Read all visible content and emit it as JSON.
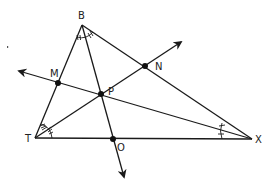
{
  "diagram": {
    "type": "triangle-angle-bisectors",
    "vertices": [
      {
        "name": "B",
        "x": 82,
        "y": 25,
        "label_x": 78,
        "label_y": 19
      },
      {
        "name": "T",
        "x": 35,
        "y": 138,
        "label_x": 25,
        "label_y": 142
      },
      {
        "name": "X",
        "x": 252,
        "y": 139,
        "label_x": 255,
        "label_y": 143
      }
    ],
    "points": [
      {
        "name": "P",
        "x": 101,
        "y": 94,
        "label_x": 108,
        "label_y": 95
      },
      {
        "name": "M",
        "x": 58,
        "y": 83,
        "label_x": 50,
        "label_y": 77
      },
      {
        "name": "N",
        "x": 145,
        "y": 66,
        "label_x": 153,
        "label_y": 70
      },
      {
        "name": "O",
        "x": 113,
        "y": 139,
        "label_x": 117,
        "label_y": 151
      }
    ],
    "labels": {
      "B": "B",
      "T": "T",
      "X": "X",
      "P": "P",
      "M": "M",
      "N": "N",
      "O": "O"
    },
    "rays": [
      {
        "from": "T",
        "through": "P",
        "to_arrow": [
          181,
          42
        ]
      },
      {
        "from": "X",
        "through": "P",
        "to_arrow": [
          19,
          71
        ]
      },
      {
        "from": "B",
        "through": "P",
        "to_arrow": [
          124,
          177
        ]
      }
    ],
    "angle_marks": {
      "B": "double tick marks on both halves",
      "T": "triple tick marks on both halves",
      "X": "single tick marks on both halves"
    },
    "stroke_color": "#1a1a1a",
    "background": "#ffffff"
  }
}
